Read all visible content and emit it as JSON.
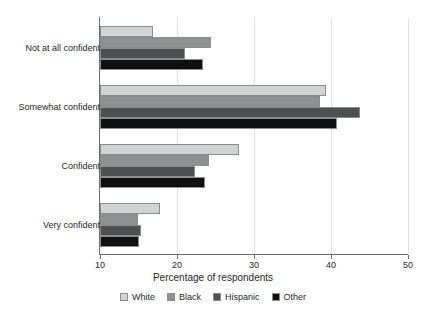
{
  "chart_data": {
    "type": "bar",
    "orientation": "horizontal",
    "title": "",
    "xlabel": "Percentage of respondents",
    "ylabel": "",
    "xlim": [
      10,
      50
    ],
    "xticks": [
      10,
      20,
      30,
      40,
      50
    ],
    "xtick_labels": [
      "10",
      "20",
      "30",
      "40",
      "50"
    ],
    "grid": true,
    "legend_position": "bottom",
    "categories": [
      "Not at all confident",
      "Somewhat confident",
      "Confident",
      "Very confident"
    ],
    "series": [
      {
        "name": "White",
        "color": "#d2d3d5",
        "values": [
          16.9,
          39.4,
          28.1,
          17.8
        ]
      },
      {
        "name": "Black",
        "color": "#8e9092",
        "values": [
          24.4,
          38.6,
          24.1,
          14.9
        ]
      },
      {
        "name": "Hispanic",
        "color": "#4d4f51",
        "values": [
          21.1,
          43.8,
          22.4,
          15.3
        ]
      },
      {
        "name": "Other",
        "color": "#101010",
        "values": [
          23.4,
          40.8,
          23.6,
          15.0
        ]
      }
    ]
  },
  "legend": {
    "items": [
      {
        "label": "White",
        "color": "#d2d3d5"
      },
      {
        "label": "Black",
        "color": "#8e9092"
      },
      {
        "label": "Hispanic",
        "color": "#4d4f51"
      },
      {
        "label": "Other",
        "color": "#101010"
      }
    ]
  },
  "axis": {
    "x_title": "Percentage of respondents"
  }
}
